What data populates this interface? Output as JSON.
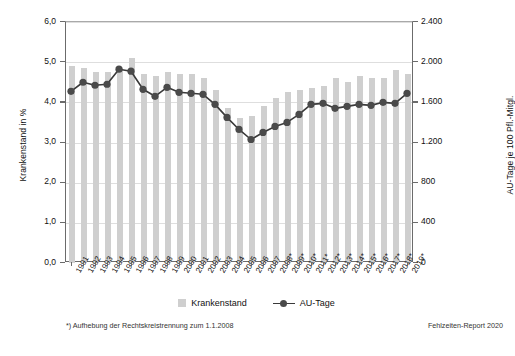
{
  "chart_data": {
    "type": "bar",
    "title": "",
    "subtitle": "",
    "xlabel": "",
    "ylabel": "Krankenstand in %",
    "y2label": "AU-Tage je 100 Pfl.-Mitgl.",
    "ylim": [
      0,
      6
    ],
    "y2lim": [
      0,
      2400
    ],
    "grid": true,
    "legend_position": "bottom-center",
    "y_ticks": [
      "0,0",
      "1,0",
      "2,0",
      "3,0",
      "4,0",
      "5,0",
      "6,0"
    ],
    "y_tick_values": [
      0,
      1,
      2,
      3,
      4,
      5,
      6
    ],
    "y2_ticks": [
      "0",
      "400",
      "800",
      "1.200",
      "1.600",
      "2.000",
      "2.400"
    ],
    "y2_tick_values": [
      0,
      400,
      800,
      1200,
      1600,
      2000,
      2400
    ],
    "categories": [
      "1991",
      "1992",
      "1993",
      "1994",
      "1995",
      "1996",
      "1997",
      "1998",
      "1999",
      "2000",
      "2001",
      "2002",
      "2003",
      "2004",
      "2005",
      "2006",
      "2007",
      "2008*",
      "2009*",
      "2010*",
      "2011*",
      "2012*",
      "2013*",
      "2014*",
      "2015*",
      "2016*",
      "2017*",
      "2018*",
      "2019*"
    ],
    "series": [
      {
        "name": "Krankenstand",
        "kind": "bar",
        "axis": "left",
        "unit": "%",
        "color": "#cfcfcf",
        "values": [
          4.9,
          4.85,
          4.75,
          4.75,
          4.85,
          5.1,
          4.7,
          4.65,
          4.75,
          4.7,
          4.7,
          4.6,
          4.3,
          3.85,
          3.6,
          3.65,
          3.9,
          4.1,
          4.25,
          4.3,
          4.35,
          4.4,
          4.6,
          4.5,
          4.65,
          4.6,
          4.6,
          4.8,
          4.7
        ]
      },
      {
        "name": "AU-Tage",
        "kind": "line",
        "axis": "right",
        "unit": "AU-Tage je 100 Pfl.-Mitgl.",
        "color": "#4a4a4a",
        "values": [
          1700,
          1790,
          1760,
          1770,
          1920,
          1900,
          1720,
          1650,
          1740,
          1690,
          1680,
          1670,
          1570,
          1440,
          1320,
          1220,
          1290,
          1350,
          1390,
          1470,
          1570,
          1580,
          1530,
          1550,
          1570,
          1560,
          1590,
          1580,
          1680
        ]
      }
    ],
    "annotations": [
      "*) Aufhebung der Rechtskreistrennung zum 1.1.2008",
      "Fehlzeiten-Report 2020"
    ]
  },
  "legend": {
    "items": [
      {
        "label": "Krankenstand",
        "marker": "square-swatch"
      },
      {
        "label": "AU-Tage",
        "marker": "line-with-dot"
      }
    ]
  },
  "footnote": "*) Aufhebung der Rechtskreistrennung zum 1.1.2008",
  "source": "Fehlzeiten-Report 2020",
  "colors": {
    "bar": "#cfcfcf",
    "line": "#3a3a3a",
    "marker": "#4a4a4a",
    "axis": "#6b6b6b",
    "grid": "#dedede",
    "background": "#ffffff"
  }
}
